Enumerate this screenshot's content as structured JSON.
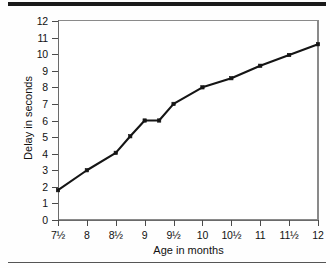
{
  "figure": {
    "top_rule_color": "#1a1a1a",
    "bottom_rule_color": "#555555",
    "line_color": "#151515",
    "axis_color": "#6a6a6a"
  },
  "chart_data": {
    "type": "line",
    "title": "",
    "xlabel": "Age in months",
    "ylabel": "Delay in seconds",
    "xlim": [
      7.5,
      12
    ],
    "ylim": [
      0,
      12
    ],
    "grid": false,
    "legend": "none",
    "x_tick_labels": [
      "7½",
      "8",
      "8½",
      "9",
      "9½",
      "10",
      "10½",
      "11",
      "11½",
      "12"
    ],
    "x": [
      7.5,
      8,
      8.5,
      9,
      9.5,
      10,
      10.5,
      11,
      11.5,
      12
    ],
    "y_tick_labels": [
      "0",
      "1",
      "2",
      "3",
      "4",
      "5",
      "6",
      "7",
      "8",
      "9",
      "10",
      "11",
      "12"
    ],
    "y_ticks": [
      0,
      1,
      2,
      3,
      4,
      5,
      6,
      7,
      8,
      9,
      10,
      11,
      12
    ],
    "values": [
      1.8,
      3.0,
      4.05,
      5.05,
      6.0,
      7.0,
      8.0,
      8.55,
      9.3,
      9.95
    ],
    "series": [
      {
        "name": "Delay",
        "marker": "square",
        "values": [
          1.8,
          3.0,
          4.05,
          5.05,
          6.0,
          7.0,
          8.0,
          8.55,
          9.3,
          9.95
        ]
      }
    ],
    "points": [
      {
        "x_label": "7½",
        "x": 7.5,
        "y": 1.8
      },
      {
        "x_label": "8",
        "x": 8.0,
        "y": 3.0
      },
      {
        "x_label": "8½",
        "x": 8.5,
        "y": 4.05
      },
      {
        "x_label": "9",
        "x": 9.0,
        "y": 6.0
      },
      {
        "x_label": "9½",
        "x": 9.5,
        "y": 7.0
      },
      {
        "x_label": "10",
        "x": 10.0,
        "y": 8.0
      },
      {
        "x_label": "10½",
        "x": 10.5,
        "y": 8.55
      },
      {
        "x_label": "11",
        "x": 11.0,
        "y": 9.3
      },
      {
        "x_label": "11½",
        "x": 11.5,
        "y": 9.95
      },
      {
        "x_label": "12",
        "x": 12.0,
        "y": 10.6
      }
    ],
    "interpolated_points": [
      {
        "x": 8.75,
        "y": 5.05
      },
      {
        "x": 9.25,
        "y": 6.0
      }
    ]
  }
}
